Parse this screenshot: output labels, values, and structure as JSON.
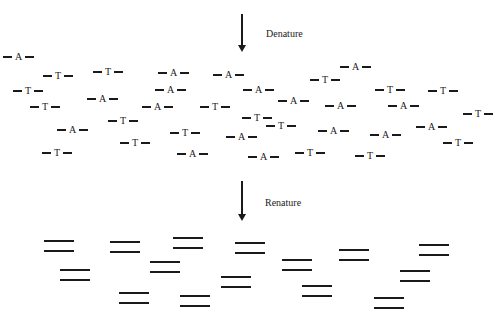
{
  "steps": {
    "denature": {
      "label": "Denature"
    },
    "renature": {
      "label": "Renature"
    }
  },
  "single_strands": [
    {
      "base": "A",
      "x": 3,
      "y": 57
    },
    {
      "base": "T",
      "x": 43,
      "y": 76
    },
    {
      "base": "T",
      "x": 93,
      "y": 72
    },
    {
      "base": "A",
      "x": 158,
      "y": 73
    },
    {
      "base": "A",
      "x": 213,
      "y": 75
    },
    {
      "base": "A",
      "x": 340,
      "y": 67
    },
    {
      "base": "T",
      "x": 310,
      "y": 80
    },
    {
      "base": "T",
      "x": 13,
      "y": 91
    },
    {
      "base": "A",
      "x": 155,
      "y": 90
    },
    {
      "base": "A",
      "x": 243,
      "y": 90
    },
    {
      "base": "T",
      "x": 375,
      "y": 90
    },
    {
      "base": "T",
      "x": 428,
      "y": 91
    },
    {
      "base": "A",
      "x": 87,
      "y": 99
    },
    {
      "base": "A",
      "x": 278,
      "y": 101
    },
    {
      "base": "A",
      "x": 325,
      "y": 106
    },
    {
      "base": "A",
      "x": 388,
      "y": 106
    },
    {
      "base": "T",
      "x": 30,
      "y": 107
    },
    {
      "base": "A",
      "x": 142,
      "y": 107
    },
    {
      "base": "T",
      "x": 200,
      "y": 107
    },
    {
      "base": "T",
      "x": 463,
      "y": 114
    },
    {
      "base": "T",
      "x": 108,
      "y": 121
    },
    {
      "base": "T",
      "x": 242,
      "y": 118
    },
    {
      "base": "T",
      "x": 266,
      "y": 126
    },
    {
      "base": "A",
      "x": 416,
      "y": 127
    },
    {
      "base": "A",
      "x": 57,
      "y": 130
    },
    {
      "base": "T",
      "x": 170,
      "y": 133
    },
    {
      "base": "A",
      "x": 226,
      "y": 137
    },
    {
      "base": "A",
      "x": 318,
      "y": 131
    },
    {
      "base": "A",
      "x": 370,
      "y": 135
    },
    {
      "base": "T",
      "x": 120,
      "y": 143
    },
    {
      "base": "T",
      "x": 443,
      "y": 143
    },
    {
      "base": "T",
      "x": 42,
      "y": 153
    },
    {
      "base": "A",
      "x": 177,
      "y": 154
    },
    {
      "base": "A",
      "x": 248,
      "y": 157
    },
    {
      "base": "T",
      "x": 295,
      "y": 153
    },
    {
      "base": "T",
      "x": 355,
      "y": 156
    }
  ],
  "duplexes": [
    {
      "x": 44,
      "y": 240
    },
    {
      "x": 110,
      "y": 241
    },
    {
      "x": 173,
      "y": 237
    },
    {
      "x": 235,
      "y": 242
    },
    {
      "x": 60,
      "y": 269
    },
    {
      "x": 150,
      "y": 261
    },
    {
      "x": 221,
      "y": 276
    },
    {
      "x": 282,
      "y": 259
    },
    {
      "x": 339,
      "y": 249
    },
    {
      "x": 419,
      "y": 244
    },
    {
      "x": 119,
      "y": 292
    },
    {
      "x": 180,
      "y": 295
    },
    {
      "x": 302,
      "y": 285
    },
    {
      "x": 400,
      "y": 270
    },
    {
      "x": 374,
      "y": 297
    }
  ],
  "arrows": [
    {
      "id": "denature-arrow",
      "x": 241,
      "y": 14,
      "length": 32
    },
    {
      "id": "renature-arrow",
      "x": 241,
      "y": 181,
      "length": 34
    }
  ]
}
